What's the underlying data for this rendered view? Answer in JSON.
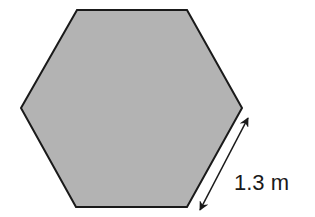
{
  "diagram": {
    "shape": "regular hexagon",
    "fill_color": "#b3b3b3",
    "stroke_color": "#1a1a1a",
    "side_label": "1.3 m",
    "dimension_marker": "double-headed arrow parallel to lower-right side"
  }
}
